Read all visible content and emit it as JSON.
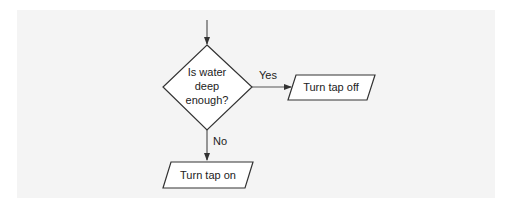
{
  "diagram": {
    "type": "flowchart",
    "colors": {
      "background": "#f4f4f4",
      "stroke": "#333333",
      "node_fill": "#ffffff",
      "text": "#222222"
    },
    "decision": {
      "lines": [
        "Is water",
        "deep",
        "enough?"
      ]
    },
    "yes_node": {
      "label": "Turn tap off"
    },
    "no_node": {
      "label": "Turn tap on"
    },
    "edges": {
      "yes_label": "Yes",
      "no_label": "No"
    }
  }
}
